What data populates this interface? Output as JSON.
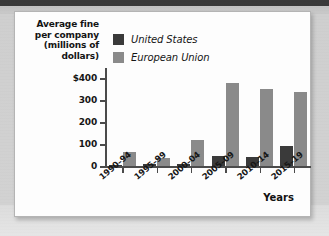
{
  "chart_data": {
    "type": "bar",
    "title": "",
    "ylabel": "Average fine per company (millions of dollars)",
    "ylabel_lines": [
      "Average fine",
      "per company",
      "(millions of",
      "dollars)"
    ],
    "xlabel": "Years",
    "categories": [
      "1990–94",
      "1995–99",
      "2000–04",
      "2005–09",
      "2010–14",
      "2015–19"
    ],
    "series": [
      {
        "name": "United States",
        "color": "#3a3a3a",
        "values": [
          3,
          10,
          10,
          45,
          43,
          93
        ]
      },
      {
        "name": "European Union",
        "color": "#8a8a8a",
        "values": [
          62,
          38,
          120,
          380,
          350,
          340
        ]
      }
    ],
    "ylim": [
      0,
      420
    ],
    "yticks": [
      0,
      100,
      200,
      300,
      400
    ],
    "ytick_labels": [
      "0",
      "100",
      "200",
      "300",
      "$400"
    ],
    "grid": false,
    "legend_position": "top-left-inside"
  }
}
